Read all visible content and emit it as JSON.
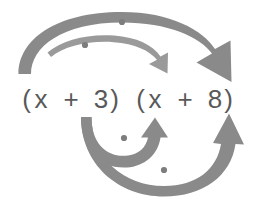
{
  "figure": {
    "background_color": "#ffffff",
    "arrow_color": "#8a8a8a",
    "thin_arrow_color": "#9a9a9a",
    "dot_color": "#7d7d7d",
    "text_color": "#595959"
  },
  "expression": {
    "full_text": "(x + 3) (x + 8)",
    "left_binomial": {
      "open_paren": "(",
      "variable": "x",
      "operator": "+",
      "constant": "3",
      "close_paren": ")"
    },
    "right_binomial": {
      "open_paren": "(",
      "variable": "x",
      "operator": "+",
      "constant": "8",
      "close_paren": ")"
    }
  },
  "arrows": [
    {
      "id": "outer",
      "label": "first-to-last",
      "from_term": "x",
      "to_term": "8",
      "position": "top-outer",
      "direction": "left-to-right",
      "style": "thick",
      "has_dot": true
    },
    {
      "id": "inner-top",
      "label": "first-to-first",
      "from_term": "x",
      "to_term": "x",
      "position": "top-inner",
      "direction": "left-to-right",
      "style": "thin",
      "has_dot": true
    },
    {
      "id": "inner-bottom",
      "label": "inner-terms",
      "from_term": "3",
      "to_term": "x",
      "position": "bottom-inner",
      "direction": "left-to-right",
      "style": "thick",
      "has_dot": true
    },
    {
      "id": "outer-bottom",
      "label": "last-to-last",
      "from_term": "3",
      "to_term": "8",
      "position": "bottom-outer",
      "direction": "left-to-right",
      "style": "thick",
      "has_dot": true
    }
  ],
  "dots": [
    {
      "id": "dot-top-outer",
      "x": 122,
      "y": 22
    },
    {
      "id": "dot-top-inner",
      "x": 85,
      "y": 45
    },
    {
      "id": "dot-bottom-inner",
      "x": 124,
      "y": 138
    },
    {
      "id": "dot-bottom-outer",
      "x": 164,
      "y": 170
    }
  ]
}
